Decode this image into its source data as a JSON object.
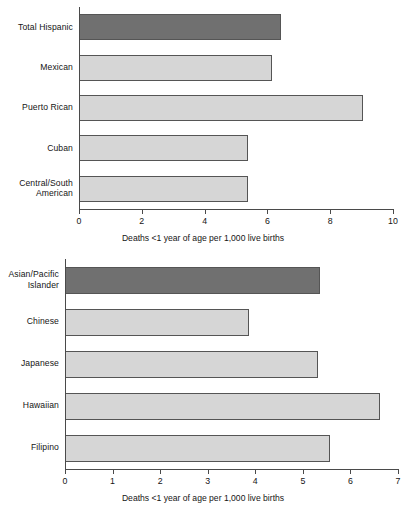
{
  "chart_data": [
    {
      "id": "hispanic",
      "type": "bar",
      "orientation": "horizontal",
      "title": "",
      "xlabel": "Deaths <1 year of age per 1,000 live births",
      "ylabel": "",
      "xlim": [
        0,
        10
      ],
      "xticks": [
        "0",
        "2",
        "4",
        "6",
        "8",
        "10"
      ],
      "xtick_values": [
        0,
        2,
        4,
        6,
        8,
        10
      ],
      "grid": false,
      "legend": "none",
      "categories": [
        "Total Hispanic",
        "Mexican",
        "Puerto Rican",
        "Cuban",
        "Central/South\nAmerican"
      ],
      "values": [
        6.4,
        6.1,
        9.0,
        5.35,
        5.35
      ],
      "highlight_index": 0,
      "colors": {
        "highlight": "#707070",
        "normal": "#d6d6d6",
        "outline": "#555555",
        "axis": "#4a4a4a",
        "text": "#151515"
      }
    },
    {
      "id": "asian-pacific",
      "type": "bar",
      "orientation": "horizontal",
      "title": "",
      "xlabel": "Deaths <1 year of age per 1,000 live births",
      "ylabel": "",
      "xlim": [
        0,
        7
      ],
      "xticks": [
        "0",
        "1",
        "2",
        "3",
        "4",
        "5",
        "6",
        "7"
      ],
      "xtick_values": [
        0,
        1,
        2,
        3,
        4,
        5,
        6,
        7
      ],
      "grid": false,
      "legend": "none",
      "categories": [
        "Asian/Pacific\nIslander",
        "Chinese",
        "Japanese",
        "Hawaiian",
        "Filipino"
      ],
      "values": [
        5.33,
        3.84,
        5.29,
        6.6,
        5.55
      ],
      "highlight_index": 0,
      "colors": {
        "highlight": "#707070",
        "normal": "#d6d6d6",
        "outline": "#555555",
        "axis": "#4a4a4a",
        "text": "#151515"
      }
    }
  ]
}
